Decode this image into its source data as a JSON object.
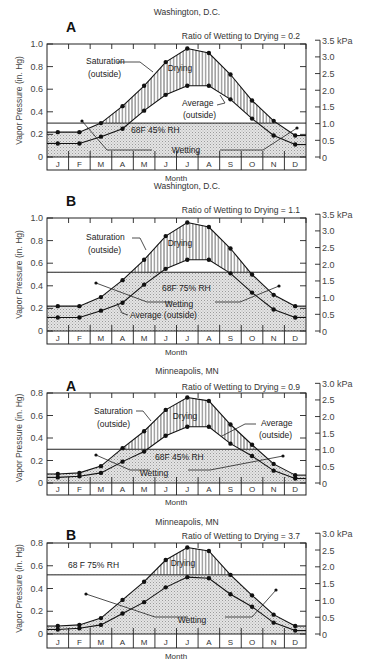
{
  "chart_data": [
    {
      "type": "line",
      "panel_letter": "A",
      "title": "Washington, D.C.",
      "subtitle": "Ratio of Wetting to Drying = 0.2",
      "xlabel": "Month",
      "ylabel": "Vapor Pressure (in. Hg)",
      "ylabel_right": "kPa",
      "ylim": [
        0,
        1.0
      ],
      "yticks": [
        "0",
        "0.2",
        "0.4",
        "0.6",
        "0.8",
        "1.0"
      ],
      "yticks_right": [
        "0",
        "0.5",
        "1.0",
        "1.5",
        "2.0",
        "2.5",
        "3.0",
        "3.5 kPa"
      ],
      "categories": [
        "J",
        "F",
        "M",
        "A",
        "M",
        "J",
        "J",
        "A",
        "S",
        "O",
        "N",
        "D"
      ],
      "indoor_condition": "68F   45% RH",
      "indoor_vapor_pressure": 0.3,
      "series": [
        {
          "name": "Saturation (outside)",
          "values": [
            0.22,
            0.22,
            0.3,
            0.45,
            0.63,
            0.84,
            0.96,
            0.92,
            0.73,
            0.5,
            0.32,
            0.19
          ]
        },
        {
          "name": "Average (outside)",
          "values": [
            0.12,
            0.12,
            0.18,
            0.25,
            0.41,
            0.55,
            0.63,
            0.63,
            0.51,
            0.34,
            0.19,
            0.11
          ]
        }
      ],
      "annotations": [
        "Saturation",
        "(outside)",
        "Drying",
        "Average",
        "(outside)",
        "Wetting"
      ]
    },
    {
      "type": "line",
      "panel_letter": "B",
      "title": "Washington, D.C.",
      "subtitle": "Ratio of Wetting to Drying = 1.1",
      "xlabel": "Month",
      "ylabel": "Vapor Pressure (in. Hg)",
      "ylabel_right": "kPa",
      "ylim": [
        0,
        1.0
      ],
      "yticks": [
        "0",
        "0.2",
        "0.4",
        "0.6",
        "0.8",
        "1.0"
      ],
      "yticks_right": [
        "0",
        "0.5",
        "1.0",
        "1.5",
        "2.0",
        "2.5",
        "3.0",
        "3.5 kPa"
      ],
      "categories": [
        "J",
        "F",
        "M",
        "A",
        "M",
        "J",
        "J",
        "A",
        "S",
        "O",
        "N",
        "D"
      ],
      "indoor_condition": "68F   75% RH",
      "indoor_vapor_pressure": 0.52,
      "series": [
        {
          "name": "Saturation (outside)",
          "values": [
            0.22,
            0.22,
            0.3,
            0.45,
            0.63,
            0.84,
            0.96,
            0.92,
            0.73,
            0.5,
            0.32,
            0.22
          ]
        },
        {
          "name": "Average (outside)",
          "values": [
            0.12,
            0.12,
            0.18,
            0.25,
            0.41,
            0.55,
            0.63,
            0.63,
            0.51,
            0.34,
            0.19,
            0.12
          ]
        }
      ],
      "annotations": [
        "Saturation",
        "(outside)",
        "Drying",
        "Wetting",
        "Average (outside)"
      ]
    },
    {
      "type": "line",
      "panel_letter": "A",
      "title": "Minneapolis, MN",
      "subtitle": "Ratio of Wetting to Drying = 0.9",
      "xlabel": "Month",
      "ylabel": "Vapor Pressure (in. Hg)",
      "ylabel_right": "kPa",
      "ylim": [
        0,
        0.8
      ],
      "yticks": [
        "0",
        "0.2",
        "0.4",
        "0.6",
        "0.8"
      ],
      "yticks_right": [
        "0",
        "0.5",
        "1.0",
        "1.5",
        "2.0",
        "2.5",
        "3.0 kPa"
      ],
      "categories": [
        "J",
        "F",
        "M",
        "A",
        "M",
        "J",
        "J",
        "A",
        "S",
        "O",
        "N",
        "D"
      ],
      "indoor_condition": "68F   45% RH",
      "indoor_vapor_pressure": 0.3,
      "series": [
        {
          "name": "Saturation (outside)",
          "values": [
            0.08,
            0.09,
            0.15,
            0.31,
            0.46,
            0.65,
            0.76,
            0.73,
            0.52,
            0.34,
            0.17,
            0.07
          ]
        },
        {
          "name": "Average (outside)",
          "values": [
            0.05,
            0.06,
            0.09,
            0.19,
            0.28,
            0.42,
            0.5,
            0.5,
            0.35,
            0.24,
            0.11,
            0.04
          ]
        }
      ],
      "annotations": [
        "Saturation",
        "(outside)",
        "Drying",
        "Average",
        "(outside)",
        "Wetting"
      ]
    },
    {
      "type": "line",
      "panel_letter": "B",
      "title": "Minneapolis, MN",
      "subtitle": "Ratio of Wetting to Drying = 3.7",
      "xlabel": "Month",
      "ylabel": "Vapor Pressure (in. Hg)",
      "ylabel_right": "kPa",
      "ylim": [
        0,
        0.8
      ],
      "yticks": [
        "0",
        "0.2",
        "0.4",
        "0.6",
        "0.8"
      ],
      "yticks_right": [
        "0",
        "0.5",
        "1.0",
        "1.5",
        "2.0",
        "2.5",
        "3.0 kPa"
      ],
      "categories": [
        "J",
        "F",
        "M",
        "A",
        "M",
        "J",
        "J",
        "A",
        "S",
        "O",
        "N",
        "D"
      ],
      "indoor_condition": "68 F    75% RH",
      "indoor_vapor_pressure": 0.52,
      "series": [
        {
          "name": "Saturation (outside)",
          "values": [
            0.07,
            0.08,
            0.14,
            0.3,
            0.46,
            0.65,
            0.76,
            0.73,
            0.52,
            0.34,
            0.17,
            0.07
          ]
        },
        {
          "name": "Average (outside)",
          "values": [
            0.04,
            0.05,
            0.08,
            0.18,
            0.28,
            0.41,
            0.5,
            0.49,
            0.35,
            0.24,
            0.1,
            0.03
          ]
        }
      ],
      "annotations": [
        "Drying",
        "Wetting"
      ]
    }
  ],
  "layout": {
    "panels": [
      {
        "top": 0,
        "plot_top": 44,
        "plot_bottom": 157,
        "month_bottom": 170,
        "month_label_y": 181,
        "city_y": 15,
        "letter_y": 32,
        "ratio_y": 39,
        "wetting_pointer": {
          "label_x": 186,
          "label_y": 150,
          "left": [
            [
              152,
              150
            ],
            [
              107,
              150
            ],
            [
              82,
              121
            ]
          ],
          "right": [
            [
              220,
              150
            ],
            [
              263,
              150
            ],
            [
              297,
              128
            ]
          ]
        },
        "sat_label": {
          "x": 86,
          "y": 64,
          "x2": 88,
          "y2": 77,
          "lead": [
            [
              117,
              62
            ],
            [
              140,
              62
            ],
            [
              153,
              72
            ]
          ]
        },
        "avg_label": {
          "x": 182,
          "y": 106,
          "x2": 183,
          "y2": 118,
          "lead": [
            [
              217,
              105
            ],
            [
              225,
              103
            ],
            [
              220,
              95
            ]
          ]
        },
        "drying": {
          "x": 180,
          "y": 71
        },
        "indoor_text": {
          "x": 131,
          "y": 133
        },
        "wet_label_text": "Wetting",
        "sat_line1": "Saturation",
        "sat_line2": "(outside)",
        "avg_line1": "Average",
        "avg_line2": "(outside)"
      },
      {
        "top": 174,
        "plot_top": 218,
        "plot_bottom": 331,
        "month_bottom": 344,
        "month_label_y": 355,
        "city_y": 189,
        "letter_y": 206,
        "ratio_y": 213,
        "wetting_pointer": {
          "label_x": 179,
          "label_y": 304,
          "left": [
            [
              172,
              302
            ],
            [
              147,
              302
            ],
            [
              96,
              283
            ]
          ],
          "right": [
            [
              215,
              302
            ],
            [
              240,
              302
            ],
            [
              279,
              286
            ]
          ]
        },
        "sat_label": {
          "x": 86,
          "y": 240,
          "x2": 88,
          "y2": 253,
          "lead": [
            [
              132,
              238
            ],
            [
              140,
              238
            ],
            [
              146,
              250
            ]
          ]
        },
        "avg_label": {
          "x": 130,
          "y": 318,
          "x2": 0,
          "y2": 0,
          "lead": [
            [
              128,
              315
            ],
            [
              122,
              313
            ],
            [
              117,
              303
            ]
          ]
        },
        "drying": {
          "x": 180,
          "y": 246
        },
        "indoor_text": {
          "x": 162,
          "y": 291
        },
        "wet_label_text": "Wetting",
        "sat_line1": "Saturation",
        "sat_line2": "(outside)",
        "avg_line1": "Average (outside)",
        "avg_line2": ""
      },
      {
        "top": 348,
        "plot_top": 393,
        "plot_bottom": 483,
        "month_bottom": 495,
        "month_label_y": 505,
        "city_y": 374,
        "letter_y": 391,
        "ratio_y": 390,
        "wetting_pointer": {
          "label_x": 154,
          "label_y": 473,
          "left": [
            [
              150,
              470
            ],
            [
              130,
              470
            ],
            [
              96,
              455
            ]
          ],
          "right": [
            [
              188,
              470
            ],
            [
              210,
              470
            ],
            [
              283,
              456
            ]
          ]
        },
        "sat_label": {
          "x": 94,
          "y": 414,
          "x2": 97,
          "y2": 427,
          "lead": [
            [
              136,
              411
            ],
            [
              143,
              411
            ],
            [
              151,
              421
            ]
          ]
        },
        "avg_label": {
          "x": 261,
          "y": 426,
          "x2": 259,
          "y2": 438,
          "lead": [
            [
              256,
              424
            ],
            [
              245,
              424
            ],
            [
              222,
              436
            ]
          ]
        },
        "drying": {
          "x": 185,
          "y": 419
        },
        "indoor_text": {
          "x": 155,
          "y": 460
        },
        "wet_label_text": "Wetting",
        "sat_line1": "Saturation",
        "sat_line2": "(outside)",
        "avg_line1": "Average",
        "avg_line2": "(outside)"
      },
      {
        "top": 500,
        "plot_top": 543,
        "plot_bottom": 634,
        "month_bottom": 648,
        "month_label_y": 659,
        "city_y": 525,
        "letter_y": 540,
        "ratio_y": 539,
        "wetting_pointer": {
          "label_x": 192,
          "label_y": 620,
          "left": [
            [
              188,
              617
            ],
            [
              155,
              617
            ],
            [
              86,
              594
            ]
          ],
          "right": [
            [
              225,
              617
            ],
            [
              252,
              617
            ],
            [
              276,
              590
            ]
          ]
        },
        "sat_label": null,
        "avg_label": null,
        "drying": {
          "x": 183,
          "y": 566
        },
        "indoor_text": {
          "x": 68,
          "y": 568
        },
        "wet_label_text": "Wetting"
      }
    ],
    "plot_left": 47,
    "plot_right": 306,
    "kpa_axis_x": 320
  }
}
